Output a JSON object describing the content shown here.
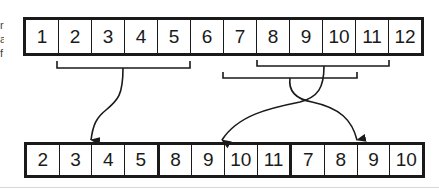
{
  "diagram": {
    "type": "array-rearrangement",
    "top_row": {
      "cells": [
        "1",
        "2",
        "3",
        "4",
        "5",
        "6",
        "7",
        "8",
        "9",
        "10",
        "11",
        "12"
      ]
    },
    "bottom_row": {
      "cells": [
        "2",
        "3",
        "4",
        "5",
        "8",
        "9",
        "10",
        "11",
        "7",
        "8",
        "9",
        "10"
      ]
    },
    "brackets": [
      {
        "label": "segment-2-5",
        "from_cell": "2",
        "to_cell": "5",
        "target_index": 0
      },
      {
        "label": "segment-8-11",
        "from_cell": "8",
        "to_cell": "11",
        "target_index": 4
      },
      {
        "label": "segment-7-10",
        "from_cell": "7",
        "to_cell": "10",
        "target_index": 8
      }
    ],
    "cropped_left_text": [
      "r",
      "a",
      "f"
    ],
    "colors": {
      "stroke": "#1a1a1a",
      "background": "#ffffff"
    }
  }
}
